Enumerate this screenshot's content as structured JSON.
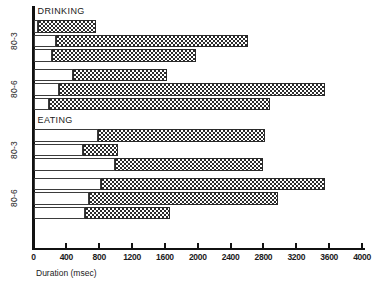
{
  "chart_data": {
    "type": "bar",
    "title": "",
    "xlabel": "Duration (msec)",
    "ylabel": "",
    "xlim": [
      0,
      4000
    ],
    "xticks": [
      0,
      400,
      800,
      1200,
      1600,
      2000,
      2400,
      2800,
      3200,
      3600,
      4000
    ],
    "xtick_labels": [
      "0",
      "400",
      "800",
      "1200",
      "1600",
      "2000",
      "2400",
      "2800",
      "3200",
      "3600",
      "4000"
    ],
    "grid": false,
    "legend": null,
    "orientation": "horizontal",
    "bar_style": "floating range bars: white leading segment plus stippled (dotted) segment",
    "sections": [
      {
        "name": "DRINKING",
        "groups": [
          {
            "label": "80-3",
            "bars": [
              {
                "start": 0,
                "fill_start": 55,
                "end": 760,
                "white_width": 55,
                "fill_width": 705
              },
              {
                "start": 0,
                "fill_start": 275,
                "end": 2610,
                "white_width": 275,
                "fill_width": 2335
              },
              {
                "start": 0,
                "fill_start": 225,
                "end": 1980,
                "white_width": 225,
                "fill_width": 1755
              }
            ]
          },
          {
            "label": "80-6",
            "bars": [
              {
                "start": 0,
                "fill_start": 480,
                "end": 1620,
                "white_width": 480,
                "fill_width": 1140
              },
              {
                "start": 0,
                "fill_start": 310,
                "end": 3545,
                "white_width": 310,
                "fill_width": 3235
              },
              {
                "start": 0,
                "fill_start": 190,
                "end": 2880,
                "white_width": 190,
                "fill_width": 2690
              }
            ]
          }
        ]
      },
      {
        "name": "EATING",
        "groups": [
          {
            "label": "80-3",
            "bars": [
              {
                "start": 0,
                "fill_start": 785,
                "end": 2815,
                "white_width": 785,
                "fill_width": 2030
              },
              {
                "start": 0,
                "fill_start": 600,
                "end": 1030,
                "white_width": 600,
                "fill_width": 430
              },
              {
                "start": 0,
                "fill_start": 990,
                "end": 2800,
                "white_width": 990,
                "fill_width": 1810
              }
            ]
          },
          {
            "label": "80-6",
            "bars": [
              {
                "start": 0,
                "fill_start": 820,
                "end": 3545,
                "white_width": 820,
                "fill_width": 2725
              },
              {
                "start": 0,
                "fill_start": 675,
                "end": 2975,
                "white_width": 675,
                "fill_width": 2300
              },
              {
                "start": 0,
                "fill_start": 625,
                "end": 1660,
                "white_width": 625,
                "fill_width": 1035
              }
            ]
          }
        ]
      }
    ]
  }
}
